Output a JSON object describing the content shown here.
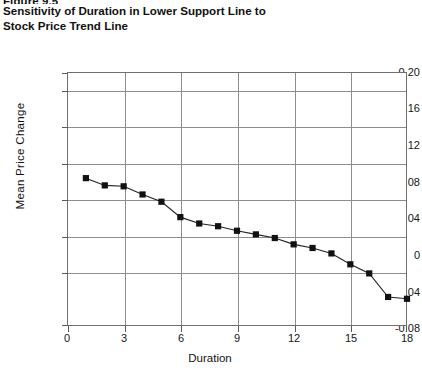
{
  "figure": {
    "number": "Figure 9.5",
    "title_line1": "Sensitivity of Duration in Lower Support Line to",
    "title_line2": "Stock Price Trend Line"
  },
  "axes": {
    "x_title": "Duration",
    "y_title": "Mean  Price  Change",
    "x_ticks": [
      "0",
      "3",
      "6",
      "9",
      "12",
      "15",
      "18"
    ],
    "y_ticks": [
      "0.20",
      "0.16",
      "0.12",
      "0.08",
      "0.04",
      "0",
      "-0.04",
      "-0.08"
    ]
  },
  "chart_data": {
    "type": "line",
    "title": "Sensitivity of Duration in Lower Support Line to Stock Price Trend Line",
    "xlabel": "Duration",
    "ylabel": "Mean Price Change",
    "xlim": [
      0,
      18
    ],
    "ylim": [
      -0.08,
      0.2
    ],
    "xticks": [
      0,
      3,
      6,
      9,
      12,
      15,
      18
    ],
    "yticks": [
      -0.08,
      -0.04,
      0,
      0.04,
      0.08,
      0.12,
      0.16,
      0.2
    ],
    "grid": "both",
    "legend": "none",
    "marker": "filled-square",
    "series": [
      {
        "name": "Mean Price Change",
        "x": [
          1,
          2,
          3,
          4,
          5,
          6,
          7,
          8,
          9,
          10,
          11,
          12,
          13,
          14,
          15,
          16,
          17,
          18
        ],
        "y": [
          0.083,
          0.075,
          0.074,
          0.065,
          0.057,
          0.04,
          0.033,
          0.03,
          0.025,
          0.021,
          0.017,
          0.01,
          0.006,
          0.0,
          -0.012,
          -0.022,
          -0.048,
          -0.05
        ]
      }
    ]
  }
}
